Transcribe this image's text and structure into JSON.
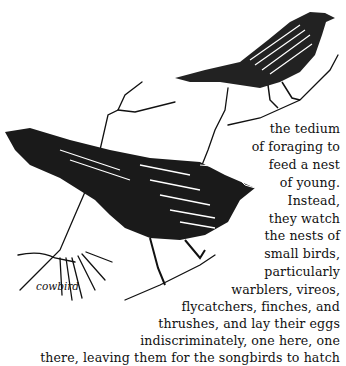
{
  "page": {
    "caption": "cowbird",
    "illustration": {
      "subjects": [
        "perched-songbird-icon",
        "cowbird-icon",
        "branch-icon"
      ]
    },
    "text_lines": [
      "the tedium",
      "of foraging to",
      "feed a nest",
      "of young.",
      "Instead,",
      "they watch",
      "the nests of",
      "small birds,",
      "particularly",
      "warblers, vireos,",
      "flycatchers, finches, and",
      "thrushes, and lay their eggs",
      "indiscriminately, one  here, one",
      "there, leaving them for the songbirds to  hatch"
    ]
  }
}
